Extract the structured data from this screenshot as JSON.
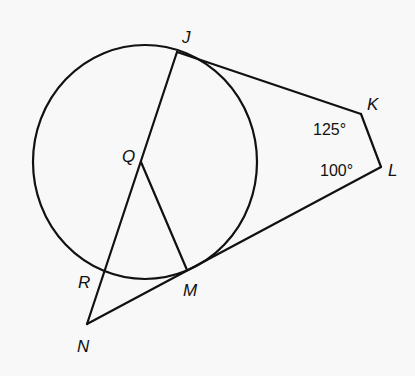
{
  "diagram": {
    "type": "geometry",
    "circle": {
      "center_label": "Q",
      "cx": 145,
      "cy": 162,
      "rx": 112,
      "ry": 117
    },
    "points": {
      "J": {
        "label": "J",
        "x": 177,
        "y": 52,
        "lx": 182,
        "ly": 43
      },
      "K": {
        "label": "K",
        "x": 361,
        "y": 114,
        "lx": 367,
        "ly": 110
      },
      "L": {
        "label": "L",
        "x": 381,
        "y": 167,
        "lx": 388,
        "ly": 176
      },
      "Q": {
        "label": "Q",
        "x": 141,
        "y": 162,
        "lx": 122,
        "ly": 162
      },
      "M": {
        "label": "M",
        "x": 187,
        "y": 270,
        "lx": 183,
        "ly": 296
      },
      "R": {
        "label": "R",
        "x": 104,
        "y": 272,
        "lx": 78,
        "ly": 288
      },
      "N": {
        "label": "N",
        "x": 87,
        "y": 324,
        "lx": 77,
        "ly": 352
      }
    },
    "segments": [
      [
        "J",
        "K"
      ],
      [
        "K",
        "L"
      ],
      [
        "L",
        "N"
      ],
      [
        "J",
        "N"
      ],
      [
        "Q",
        "M"
      ]
    ],
    "angle_labels": [
      {
        "vertex": "K",
        "text": "125°",
        "x": 313,
        "y": 135
      },
      {
        "vertex": "L",
        "text": "100°",
        "x": 320,
        "y": 176
      }
    ]
  }
}
